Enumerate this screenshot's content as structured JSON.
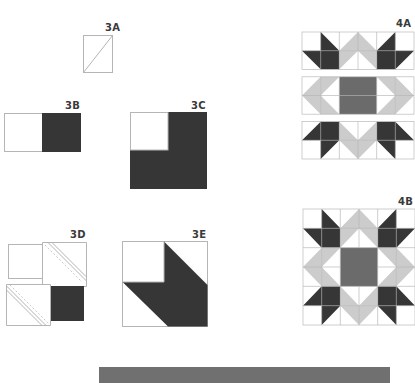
{
  "figures": {
    "f3a": {
      "label": "3A"
    },
    "f3b": {
      "label": "3B"
    },
    "f3c": {
      "label": "3C"
    },
    "f3d": {
      "label": "3D"
    },
    "f3e": {
      "label": "3E"
    },
    "f4a": {
      "label": "4A"
    },
    "f4b": {
      "label": "4B"
    }
  },
  "colors": {
    "dark": "#363636",
    "medium": "#6b6b6b",
    "light": "#cccccc",
    "line": "#b5b5b5",
    "bar": "#707070"
  }
}
